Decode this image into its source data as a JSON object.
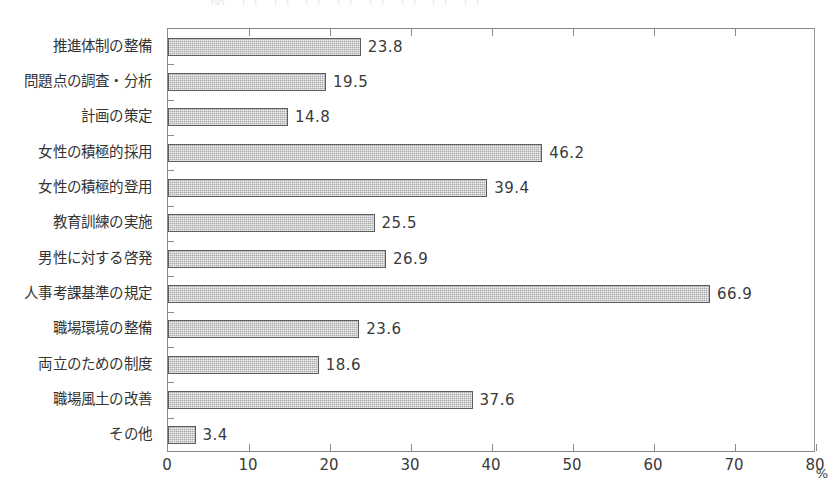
{
  "chart_data": {
    "type": "bar",
    "orientation": "horizontal",
    "title": "",
    "xlabel": "%",
    "ylabel": "",
    "xlim": [
      0,
      80
    ],
    "xticks": [
      0,
      10,
      20,
      30,
      40,
      50,
      60,
      70,
      80
    ],
    "grid": false,
    "legend": null,
    "bar_fill": "#a9a9a9",
    "bar_border": "#5d5d5d",
    "axis_color": "#8a8a8a",
    "categories": [
      "推進体制の整備",
      "問題点の調査・分析",
      "計画の策定",
      "女性の積極的採用",
      "女性の積極的登用",
      "教育訓練の実施",
      "男性に対する啓発",
      "人事考課基準の規定",
      "職場環境の整備",
      "両立のための制度",
      "職場風土の改善",
      "その他"
    ],
    "values": [
      23.8,
      19.5,
      14.8,
      46.2,
      39.4,
      25.5,
      26.9,
      66.9,
      23.6,
      18.6,
      37.6,
      3.4
    ],
    "value_labels": [
      "23.8",
      "19.5",
      "14.8",
      "46.2",
      "39.4",
      "25.5",
      "26.9",
      "66.9",
      "23.6",
      "18.6",
      "37.6",
      "3.4"
    ],
    "xtick_labels": [
      "0",
      "10",
      "20",
      "30",
      "40",
      "50",
      "60",
      "70",
      "80"
    ]
  },
  "axis": {
    "unit_label": "%"
  },
  "title_remnant": "図 〇 〇 〇 〇 〇 〇 〇 〇"
}
